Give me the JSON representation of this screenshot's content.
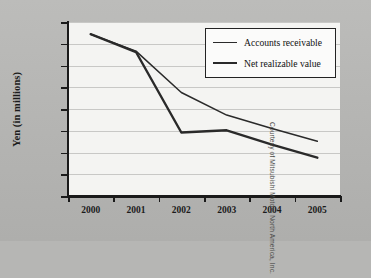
{
  "chart_data": {
    "type": "line",
    "title": "",
    "xlabel": "",
    "ylabel": "Yen (in millions)",
    "categories": [
      "2000",
      "2001",
      "2002",
      "2003",
      "2004",
      "2005"
    ],
    "x": [
      2000,
      2001,
      2002,
      2003,
      2004,
      2005
    ],
    "series": [
      {
        "name": "Accounts receivable",
        "values": [
          372000,
          333000,
          238000,
          186000,
          155000,
          126000
        ]
      },
      {
        "name": "Net realizable value",
        "values": [
          372000,
          331000,
          146000,
          151000,
          118000,
          88000
        ]
      }
    ],
    "ylim": [
      0,
      400000
    ],
    "yticks": [
      0,
      50000,
      100000,
      150000,
      200000,
      250000,
      300000,
      350000,
      400000
    ],
    "ytick_labels": [
      "¥0",
      "¥50,000",
      "¥100,000",
      "¥150,000",
      "¥200,000",
      "¥250,000",
      "¥300,000",
      "¥350,000",
      "¥400,000"
    ],
    "grid": true,
    "legend_position": "top-right",
    "line_color": "#2a2a2a"
  },
  "credit": "Courtesy of Mitsubishi Motors North America, Inc.",
  "colors": {
    "background": "#b6b6b4",
    "plot_background": "#f4f4f2",
    "gridline": "#c8c8c6",
    "axis": "#1a1a1a",
    "line": "#2a2a2a",
    "legend_background": "#fbfbfa",
    "legend_border": "#232323"
  }
}
